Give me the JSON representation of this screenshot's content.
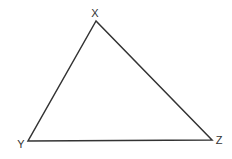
{
  "diagram": {
    "type": "triangle",
    "vertices": [
      {
        "label": "X",
        "x": 96,
        "y": 21,
        "label_x": 95,
        "label_y": 17
      },
      {
        "label": "Y",
        "x": 28,
        "y": 141,
        "label_x": 21,
        "label_y": 148
      },
      {
        "label": "Z",
        "x": 212,
        "y": 140,
        "label_x": 219,
        "label_y": 144
      }
    ],
    "stroke_color": "#333333",
    "stroke_width": 1.5
  }
}
